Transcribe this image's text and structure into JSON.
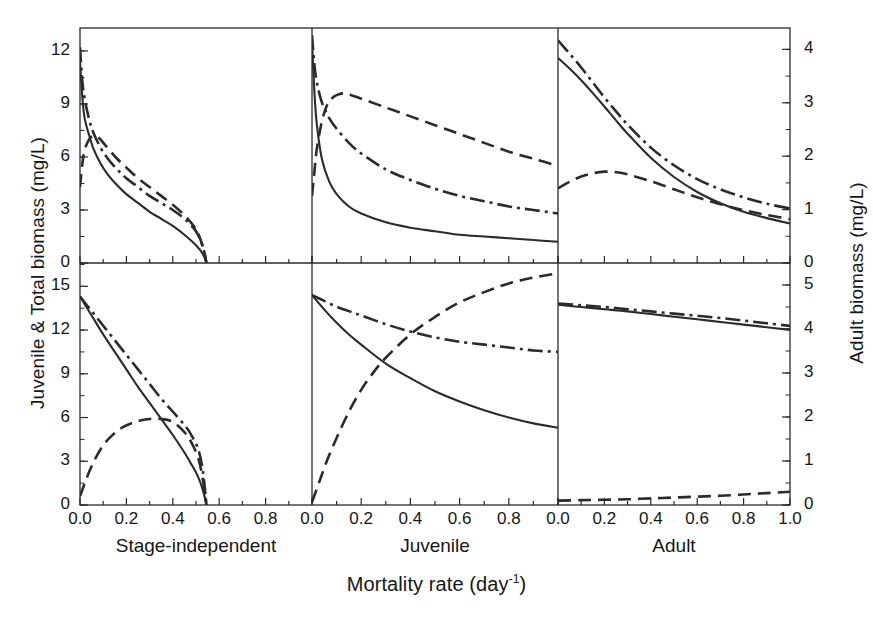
{
  "figure": {
    "axes": {
      "y_left_title": "Juvenile & Total biomass (mg/L)",
      "y_right_title": "Adult biomass (mg/L)",
      "x_title_main": "Mortality rate (day",
      "x_title_sup": "-1",
      "x_title_close": ")"
    },
    "column_labels": [
      "Stage-independent",
      "Juvenile",
      "Adult"
    ],
    "x_ticks": [
      "0.0",
      "0.2",
      "0.4",
      "0.6",
      "0.8",
      "1.0"
    ],
    "y_ticks_top_left": [
      "12",
      "9",
      "6",
      "3",
      "0"
    ],
    "y_ticks_bottom_left": [
      "15",
      "12",
      "9",
      "6",
      "3",
      "0"
    ],
    "y_ticks_top_right": [
      "4",
      "3",
      "2",
      "1",
      "0"
    ],
    "y_ticks_bottom_right": [
      "5",
      "4",
      "3",
      "2",
      "1",
      "0"
    ],
    "line_color": "#2b2b2b"
  },
  "chart_data": {
    "type": "line",
    "title": "",
    "xlabel": "Mortality rate (day^-1)",
    "ylabel_left": "Juvenile & Total biomass (mg/L)",
    "ylabel_right": "Adult biomass (mg/L)",
    "grid": false,
    "legend_position": "none",
    "layout": {
      "rows": 2,
      "cols": 3
    },
    "column_labels": [
      "Stage-independent",
      "Juvenile",
      "Adult"
    ],
    "row_meaning": [
      "top row",
      "bottom row"
    ],
    "line_styles": {
      "solid": "solid curve",
      "dashed": "dashed curve",
      "dashdot": "dash-dot curve"
    },
    "xlim": [
      0.0,
      1.0
    ],
    "x_tick_values": [
      0.0,
      0.2,
      0.4,
      0.6,
      0.8,
      1.0
    ],
    "panels": [
      {
        "id": "top-left",
        "column": "Stage-independent",
        "row": "top",
        "axis": "left",
        "ylim": [
          0,
          13.3
        ],
        "y_tick_values": [
          0,
          3,
          6,
          9,
          12
        ],
        "series": [
          {
            "name": "solid",
            "style": "solid",
            "x": [
              0.0,
              0.01,
              0.02,
              0.04,
              0.06,
              0.09,
              0.12,
              0.16,
              0.2,
              0.25,
              0.3,
              0.35,
              0.4,
              0.45,
              0.5,
              0.53,
              0.545
            ],
            "y": [
              11.4,
              9.4,
              8.2,
              7.2,
              6.4,
              5.6,
              5.0,
              4.4,
              3.9,
              3.4,
              2.9,
              2.5,
              2.1,
              1.6,
              1.0,
              0.5,
              0.0
            ]
          },
          {
            "name": "dashed",
            "style": "dashed",
            "x": [
              0.0,
              0.01,
              0.02,
              0.04,
              0.06,
              0.08,
              0.12,
              0.16,
              0.2,
              0.25,
              0.3,
              0.35,
              0.4,
              0.45,
              0.5,
              0.53,
              0.545
            ],
            "y": [
              4.3,
              5.6,
              6.4,
              7.0,
              7.2,
              7.1,
              6.5,
              5.9,
              5.4,
              4.8,
              4.3,
              3.8,
              3.3,
              2.7,
              1.9,
              0.9,
              0.0
            ]
          },
          {
            "name": "dashdot",
            "style": "dashdot",
            "x": [
              0.0,
              0.01,
              0.02,
              0.04,
              0.06,
              0.09,
              0.12,
              0.16,
              0.2,
              0.25,
              0.3,
              0.35,
              0.4,
              0.45,
              0.5,
              0.53,
              0.545
            ],
            "y": [
              12.2,
              10.3,
              9.3,
              8.1,
              7.3,
              6.5,
              5.9,
              5.3,
              4.8,
              4.3,
              3.8,
              3.4,
              3.0,
              2.5,
              1.8,
              0.9,
              0.0
            ]
          }
        ]
      },
      {
        "id": "top-middle",
        "column": "Juvenile",
        "row": "top",
        "axis": "left",
        "ylim": [
          0,
          13.3
        ],
        "y_tick_values": [
          0,
          3,
          6,
          9,
          12
        ],
        "series": [
          {
            "name": "solid",
            "style": "solid",
            "x": [
              0.0,
              0.01,
              0.02,
              0.04,
              0.07,
              0.1,
              0.15,
              0.2,
              0.3,
              0.4,
              0.5,
              0.6,
              0.7,
              0.8,
              0.9,
              1.0
            ],
            "y": [
              12.6,
              9.6,
              7.8,
              5.9,
              4.6,
              3.9,
              3.2,
              2.8,
              2.3,
              2.0,
              1.8,
              1.6,
              1.5,
              1.4,
              1.3,
              1.2
            ]
          },
          {
            "name": "dashed",
            "style": "dashed",
            "x": [
              0.0,
              0.01,
              0.02,
              0.04,
              0.06,
              0.08,
              0.1,
              0.13,
              0.16,
              0.2,
              0.3,
              0.4,
              0.5,
              0.6,
              0.7,
              0.8,
              0.9,
              1.0
            ],
            "y": [
              3.8,
              5.2,
              6.5,
              8.0,
              8.9,
              9.3,
              9.5,
              9.6,
              9.5,
              9.3,
              8.8,
              8.3,
              7.8,
              7.3,
              6.8,
              6.3,
              5.9,
              5.5
            ]
          },
          {
            "name": "dashdot",
            "style": "dashdot",
            "x": [
              0.0,
              0.01,
              0.02,
              0.04,
              0.07,
              0.1,
              0.15,
              0.2,
              0.3,
              0.4,
              0.5,
              0.6,
              0.7,
              0.8,
              0.9,
              1.0
            ],
            "y": [
              12.9,
              11.2,
              10.2,
              9.1,
              8.2,
              7.6,
              6.8,
              6.2,
              5.3,
              4.7,
              4.2,
              3.8,
              3.5,
              3.2,
              3.0,
              2.8
            ]
          }
        ]
      },
      {
        "id": "top-right",
        "column": "Adult",
        "row": "top",
        "axis": "right",
        "ylim": [
          0,
          4.4
        ],
        "y_tick_values": [
          0,
          1,
          2,
          3,
          4
        ],
        "series": [
          {
            "name": "solid",
            "style": "solid",
            "x": [
              0.0,
              0.05,
              0.1,
              0.15,
              0.2,
              0.25,
              0.3,
              0.4,
              0.5,
              0.6,
              0.7,
              0.8,
              0.9,
              1.0
            ],
            "y": [
              3.84,
              3.64,
              3.42,
              3.18,
              2.93,
              2.67,
              2.42,
              1.97,
              1.61,
              1.33,
              1.12,
              0.96,
              0.84,
              0.74
            ]
          },
          {
            "name": "dashed",
            "style": "dashed",
            "x": [
              0.0,
              0.05,
              0.1,
              0.15,
              0.2,
              0.25,
              0.3,
              0.4,
              0.5,
              0.6,
              0.7,
              0.8,
              0.9,
              1.0
            ],
            "y": [
              1.4,
              1.52,
              1.62,
              1.68,
              1.71,
              1.7,
              1.66,
              1.53,
              1.38,
              1.23,
              1.1,
              0.99,
              0.9,
              0.82
            ]
          },
          {
            "name": "dashdot",
            "style": "dashdot",
            "x": [
              0.0,
              0.05,
              0.1,
              0.15,
              0.2,
              0.25,
              0.3,
              0.4,
              0.5,
              0.6,
              0.7,
              0.8,
              0.9,
              1.0
            ],
            "y": [
              4.17,
              3.92,
              3.66,
              3.38,
              3.1,
              2.84,
              2.59,
              2.16,
              1.83,
              1.57,
              1.38,
              1.23,
              1.11,
              1.02
            ]
          }
        ]
      },
      {
        "id": "bottom-left",
        "column": "Stage-independent",
        "row": "bottom",
        "axis": "left",
        "ylim": [
          0,
          16.6
        ],
        "y_tick_values": [
          0,
          3,
          6,
          9,
          12,
          15
        ],
        "series": [
          {
            "name": "solid",
            "style": "solid",
            "x": [
              0.0,
              0.05,
              0.1,
              0.15,
              0.2,
              0.25,
              0.3,
              0.35,
              0.4,
              0.45,
              0.48,
              0.51,
              0.53,
              0.545
            ],
            "y": [
              14.3,
              13.0,
              11.7,
              10.5,
              9.3,
              8.1,
              7.0,
              5.9,
              4.8,
              3.6,
              2.8,
              1.9,
              1.0,
              0.0
            ]
          },
          {
            "name": "dashed",
            "style": "dashed",
            "x": [
              0.0,
              0.03,
              0.06,
              0.1,
              0.14,
              0.18,
              0.22,
              0.26,
              0.3,
              0.35,
              0.4,
              0.45,
              0.48,
              0.51,
              0.53,
              0.545
            ],
            "y": [
              0.6,
              1.9,
              3.0,
              4.1,
              4.8,
              5.3,
              5.6,
              5.8,
              5.9,
              5.9,
              5.7,
              5.0,
              4.3,
              3.2,
              1.7,
              0.0
            ]
          },
          {
            "name": "dashdot",
            "style": "dashdot",
            "x": [
              0.0,
              0.05,
              0.1,
              0.15,
              0.2,
              0.25,
              0.3,
              0.35,
              0.4,
              0.45,
              0.48,
              0.51,
              0.53,
              0.545
            ],
            "y": [
              14.3,
              13.3,
              12.3,
              11.3,
              10.3,
              9.3,
              8.3,
              7.3,
              6.4,
              5.5,
              4.8,
              3.8,
              2.3,
              0.0
            ]
          }
        ]
      },
      {
        "id": "bottom-middle",
        "column": "Juvenile",
        "row": "bottom",
        "axis": "left",
        "ylim": [
          0,
          16.6
        ],
        "y_tick_values": [
          0,
          3,
          6,
          9,
          12,
          15
        ],
        "series": [
          {
            "name": "solid",
            "style": "solid",
            "x": [
              0.0,
              0.05,
              0.1,
              0.15,
              0.2,
              0.3,
              0.4,
              0.5,
              0.6,
              0.7,
              0.8,
              0.9,
              1.0
            ],
            "y": [
              14.4,
              13.4,
              12.5,
              11.7,
              11.0,
              9.7,
              8.7,
              7.8,
              7.1,
              6.5,
              6.0,
              5.6,
              5.3
            ]
          },
          {
            "name": "dashed",
            "style": "dashed",
            "x": [
              0.0,
              0.03,
              0.06,
              0.1,
              0.15,
              0.2,
              0.25,
              0.3,
              0.4,
              0.5,
              0.6,
              0.7,
              0.8,
              0.9,
              1.0
            ],
            "y": [
              0.2,
              1.6,
              3.0,
              4.6,
              6.4,
              7.9,
              9.1,
              10.1,
              11.7,
              12.9,
              13.9,
              14.6,
              15.2,
              15.6,
              15.9
            ]
          },
          {
            "name": "dashdot",
            "style": "dashdot",
            "x": [
              0.0,
              0.05,
              0.1,
              0.15,
              0.2,
              0.3,
              0.4,
              0.5,
              0.6,
              0.7,
              0.8,
              0.9,
              1.0
            ],
            "y": [
              14.4,
              14.0,
              13.6,
              13.3,
              13.0,
              12.4,
              11.9,
              11.5,
              11.2,
              11.0,
              10.8,
              10.6,
              10.5
            ]
          }
        ]
      },
      {
        "id": "bottom-right",
        "column": "Adult",
        "row": "bottom",
        "axis": "right",
        "ylim": [
          0,
          5.5
        ],
        "y_tick_values": [
          0,
          1,
          2,
          3,
          4,
          5
        ],
        "series": [
          {
            "name": "solid",
            "style": "solid",
            "x": [
              0.0,
              0.1,
              0.2,
              0.3,
              0.4,
              0.5,
              0.6,
              0.7,
              0.8,
              0.9,
              1.0
            ],
            "y": [
              4.55,
              4.5,
              4.45,
              4.4,
              4.34,
              4.28,
              4.22,
              4.16,
              4.1,
              4.04,
              3.98
            ]
          },
          {
            "name": "dashed",
            "style": "dashed",
            "x": [
              0.0,
              0.1,
              0.2,
              0.3,
              0.4,
              0.5,
              0.6,
              0.7,
              0.8,
              0.9,
              1.0
            ],
            "y": [
              0.1,
              0.11,
              0.12,
              0.13,
              0.15,
              0.17,
              0.19,
              0.21,
              0.24,
              0.27,
              0.3
            ]
          },
          {
            "name": "dashdot",
            "style": "dashdot",
            "x": [
              0.0,
              0.1,
              0.2,
              0.3,
              0.4,
              0.5,
              0.6,
              0.7,
              0.8,
              0.9,
              1.0
            ],
            "y": [
              4.58,
              4.54,
              4.5,
              4.45,
              4.4,
              4.35,
              4.3,
              4.25,
              4.19,
              4.13,
              4.07
            ]
          }
        ]
      }
    ]
  }
}
